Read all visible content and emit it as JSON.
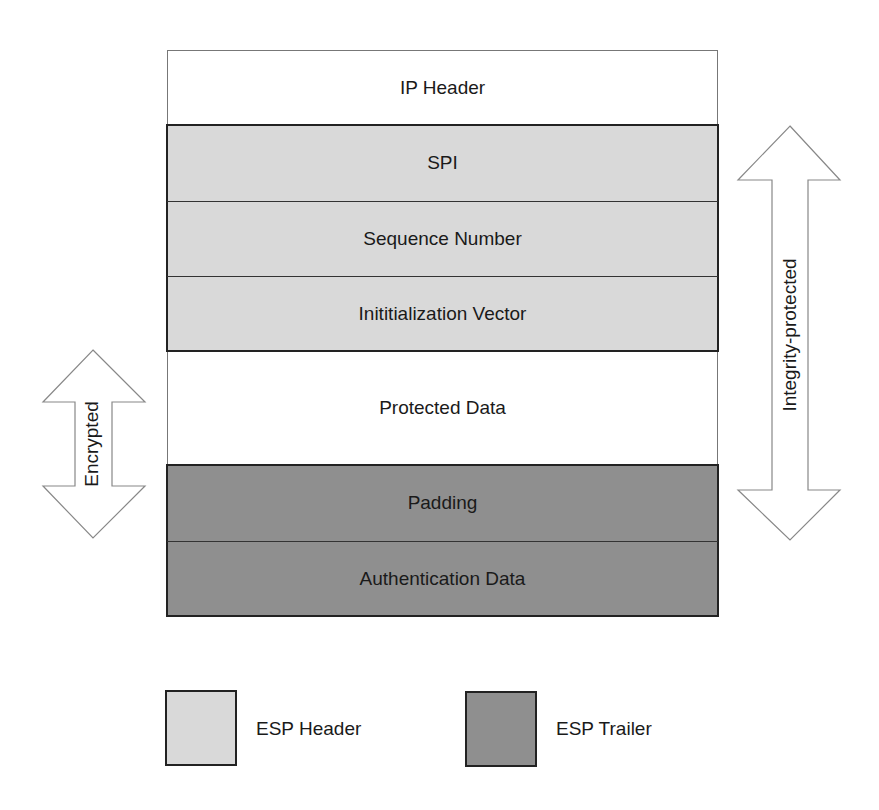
{
  "diagram": {
    "fields": [
      {
        "label": "IP Header",
        "group": "none"
      },
      {
        "label": "SPI",
        "group": "esp-header"
      },
      {
        "label": "Sequence Number",
        "group": "esp-header"
      },
      {
        "label": "Inititialization Vector",
        "group": "esp-header"
      },
      {
        "label": "Protected Data",
        "group": "none"
      },
      {
        "label": "Padding",
        "group": "esp-trailer"
      },
      {
        "label": "Authentication Data",
        "group": "esp-trailer"
      }
    ],
    "arrows": {
      "encrypted": {
        "label": "Encrypted",
        "spans": [
          "Protected Data",
          "Padding"
        ]
      },
      "integrity": {
        "label": "Integrity-protected",
        "spans": [
          "SPI",
          "Sequence Number",
          "Inititialization Vector",
          "Protected Data",
          "Padding"
        ]
      }
    },
    "legend": [
      {
        "label": "ESP Header",
        "color": "#d9d9d9"
      },
      {
        "label": "ESP Trailer",
        "color": "#8f8f8f"
      }
    ],
    "colors": {
      "esp_header": "#d9d9d9",
      "esp_trailer": "#8f8f8f",
      "plain": "#ffffff",
      "border": "#222222"
    }
  }
}
